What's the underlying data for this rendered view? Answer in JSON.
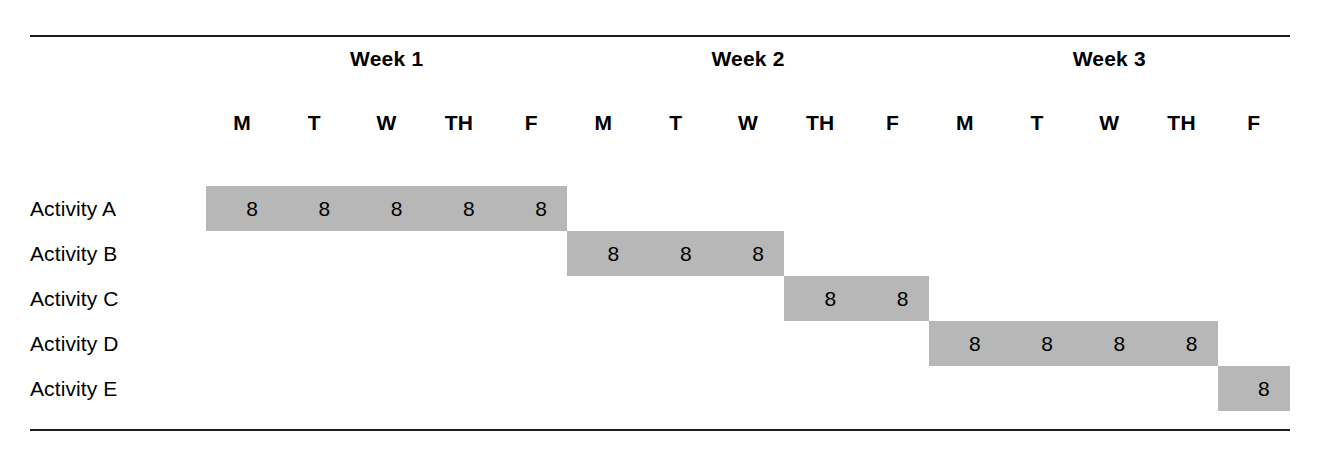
{
  "figure": {
    "kind": "gantt-chart",
    "bar_color": "#b7b7b7",
    "rule_color": "#1d1d1d",
    "background": "#ffffff"
  },
  "top_sliver": {
    "text": ""
  },
  "header": {
    "weeks": [
      {
        "label": "Week 1"
      },
      {
        "label": "Week 2"
      },
      {
        "label": "Week 3"
      }
    ],
    "days": [
      {
        "label": "M"
      },
      {
        "label": "T"
      },
      {
        "label": "W"
      },
      {
        "label": "TH"
      },
      {
        "label": "F"
      },
      {
        "label": "M"
      },
      {
        "label": "T"
      },
      {
        "label": "W"
      },
      {
        "label": "TH"
      },
      {
        "label": "F"
      },
      {
        "label": "M"
      },
      {
        "label": "T"
      },
      {
        "label": "W"
      },
      {
        "label": "TH"
      },
      {
        "label": "F"
      }
    ]
  },
  "rows": [
    {
      "label": "Activity A"
    },
    {
      "label": "Activity B"
    },
    {
      "label": "Activity C"
    },
    {
      "label": "Activity D"
    },
    {
      "label": "Activity E"
    }
  ],
  "chart_data": {
    "type": "bar",
    "title": "",
    "xlabel": "",
    "ylabel": "",
    "orientation": "horizontal-timeline",
    "grid": false,
    "legend": null,
    "x_axis": {
      "groups": [
        "Week 1",
        "Week 2",
        "Week 3"
      ],
      "group_size": 5,
      "tick_labels": [
        "M",
        "T",
        "W",
        "TH",
        "F",
        "M",
        "T",
        "W",
        "TH",
        "F",
        "M",
        "T",
        "W",
        "TH",
        "F"
      ],
      "column_count": 15
    },
    "categories": [
      "Activity A",
      "Activity B",
      "Activity C",
      "Activity D",
      "Activity E"
    ],
    "tasks": [
      {
        "name": "Activity A",
        "start_day": 1,
        "end_day": 5,
        "duration_days": 5,
        "week_span": "Week 1 M – Week 1 F",
        "cell_values": [
          "8",
          "8",
          "8",
          "8",
          "8"
        ],
        "total_hours": 40
      },
      {
        "name": "Activity B",
        "start_day": 6,
        "end_day": 8,
        "duration_days": 3,
        "week_span": "Week 2 M – Week 2 W",
        "cell_values": [
          "8",
          "8",
          "8"
        ],
        "total_hours": 24
      },
      {
        "name": "Activity C",
        "start_day": 9,
        "end_day": 10,
        "duration_days": 2,
        "week_span": "Week 2 TH – Week 2 F",
        "cell_values": [
          "8",
          "8"
        ],
        "total_hours": 16
      },
      {
        "name": "Activity D",
        "start_day": 11,
        "end_day": 14,
        "duration_days": 4,
        "week_span": "Week 3 M – Week 3 TH",
        "cell_values": [
          "8",
          "8",
          "8",
          "8"
        ],
        "total_hours": 32
      },
      {
        "name": "Activity E",
        "start_day": 15,
        "end_day": 15,
        "duration_days": 1,
        "week_span": "Week 3 F",
        "cell_values": [
          "8"
        ],
        "total_hours": 8
      }
    ]
  }
}
